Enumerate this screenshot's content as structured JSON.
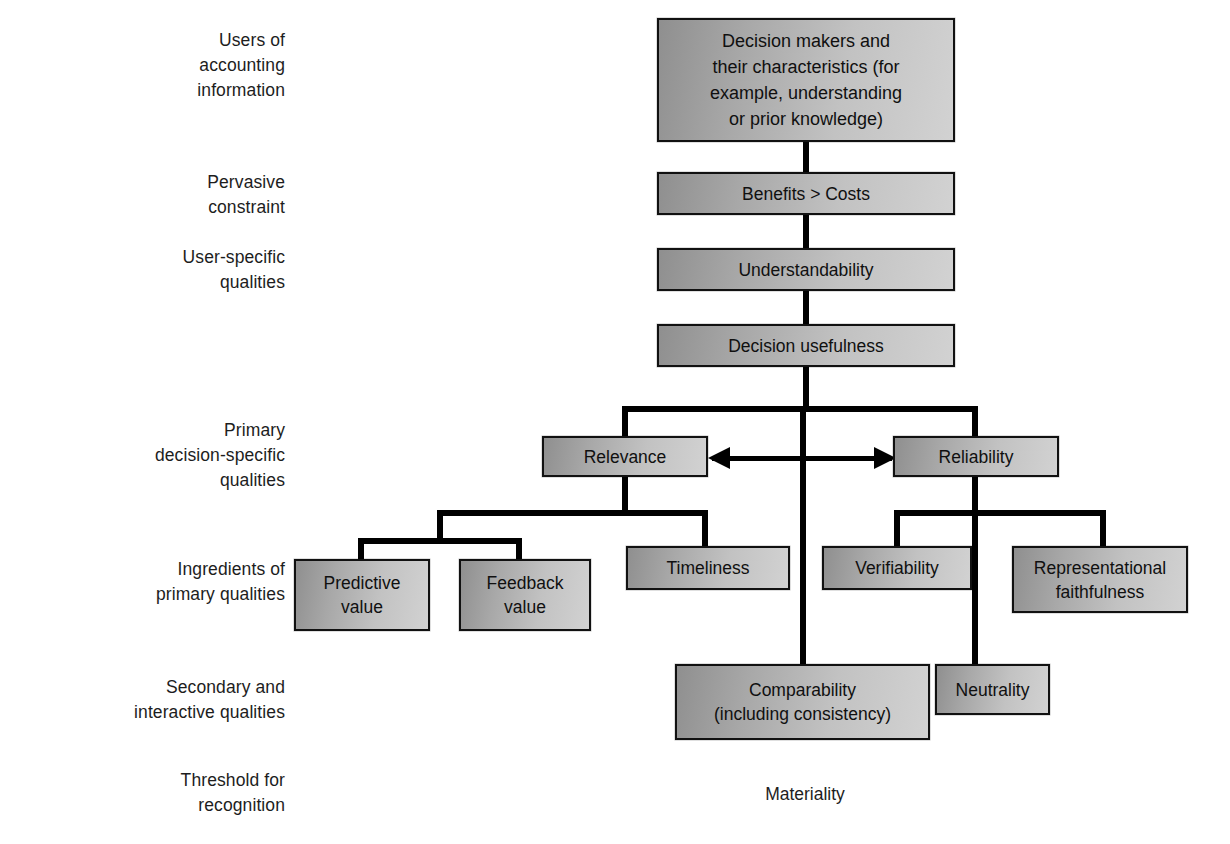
{
  "diagram": {
    "row_labels": [
      {
        "id": "users-of-accounting-information",
        "text": "Users of\naccounting\ninformation"
      },
      {
        "id": "pervasive-constraint",
        "text": "Pervasive\nconstraint"
      },
      {
        "id": "user-specific-qualities",
        "text": "User-specific\nqualities"
      },
      {
        "id": "primary-decision-specific-qualities",
        "text": "Primary\ndecision-specific\nqualities"
      },
      {
        "id": "ingredients-of-primary-qualities",
        "text": "Ingredients of\nprimary qualities"
      },
      {
        "id": "secondary-and-interactive-qualities",
        "text": "Secondary and\ninteractive qualities"
      },
      {
        "id": "threshold-for-recognition",
        "text": "Threshold for\nrecognition"
      }
    ],
    "nodes": {
      "decision_makers": "Decision makers and\ntheir characteristics (for\nexample, understanding\nor prior knowledge)",
      "benefits_costs": "Benefits > Costs",
      "understandability": "Understandability",
      "decision_usefulness": "Decision usefulness",
      "relevance": "Relevance",
      "reliability": "Reliability",
      "predictive_value": "Predictive\nvalue",
      "feedback_value": "Feedback\nvalue",
      "timeliness": "Timeliness",
      "verifiability": "Verifiability",
      "representational_faithfulness": "Representational\nfaithfulness",
      "comparability": "Comparability\n(including consistency)",
      "neutrality": "Neutrality"
    },
    "footer_text": "Materiality",
    "colors": {
      "box_fill_dark": "#8f8f8f",
      "box_fill_light": "#d2d2d2",
      "box_border": "#111111",
      "connector": "#000000",
      "text": "#1a1a1a",
      "background": "#ffffff"
    }
  }
}
